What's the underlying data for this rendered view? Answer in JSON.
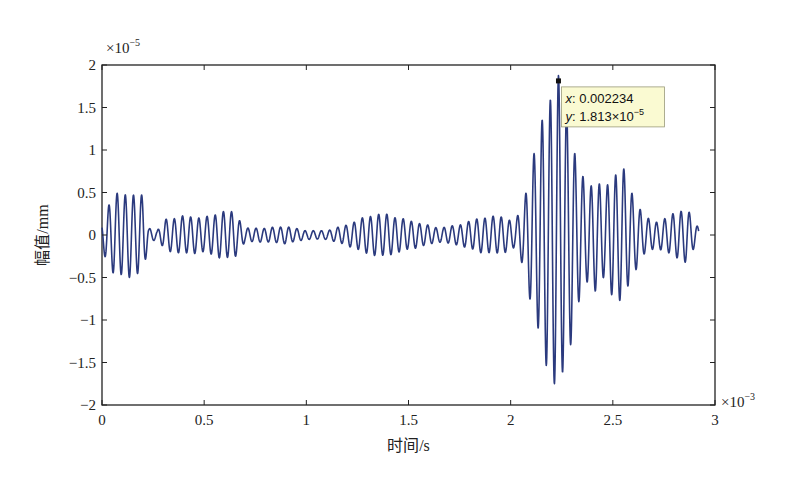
{
  "chart_data": {
    "type": "line",
    "title": "",
    "xlabel": "时间/s",
    "ylabel": "幅值/mm",
    "x_multiplier_label": "×10",
    "x_multiplier_exp": "−3",
    "y_multiplier_label": "×10",
    "y_multiplier_exp": "−5",
    "xlim": [
      0,
      3
    ],
    "ylim": [
      -2,
      2
    ],
    "x_ticks": [
      "0",
      "0.5",
      "1",
      "1.5",
      "2",
      "2.5",
      "3"
    ],
    "y_ticks": [
      "−2",
      "−1.5",
      "−1",
      "−0.5",
      "0",
      "0.5",
      "1",
      "1.5",
      "2"
    ],
    "grid": false,
    "legend": null,
    "line_color": "#2b3a7e",
    "series": [
      {
        "name": "displacement",
        "description": "Oscillating vibration signal (~25 kHz carrier) with amplitude envelope; x in ms (×10^-3 s), y in ×10^-5 mm",
        "x_end": 2.92,
        "carrier_period": 0.04,
        "envelope": [
          [
            0.0,
            0.15
          ],
          [
            0.03,
            0.35
          ],
          [
            0.06,
            0.47
          ],
          [
            0.1,
            0.48
          ],
          [
            0.15,
            0.48
          ],
          [
            0.2,
            0.45
          ],
          [
            0.23,
            0.08
          ],
          [
            0.27,
            0.05
          ],
          [
            0.31,
            0.18
          ],
          [
            0.4,
            0.22
          ],
          [
            0.5,
            0.2
          ],
          [
            0.6,
            0.28
          ],
          [
            0.65,
            0.26
          ],
          [
            0.7,
            0.08
          ],
          [
            0.8,
            0.08
          ],
          [
            0.9,
            0.1
          ],
          [
            1.0,
            0.05
          ],
          [
            1.1,
            0.05
          ],
          [
            1.2,
            0.12
          ],
          [
            1.3,
            0.22
          ],
          [
            1.38,
            0.25
          ],
          [
            1.45,
            0.2
          ],
          [
            1.55,
            0.14
          ],
          [
            1.65,
            0.08
          ],
          [
            1.75,
            0.12
          ],
          [
            1.85,
            0.2
          ],
          [
            1.95,
            0.22
          ],
          [
            2.02,
            0.15
          ],
          [
            2.06,
            0.35
          ],
          [
            2.1,
            0.8
          ],
          [
            2.15,
            1.3
          ],
          [
            2.2,
            1.7
          ],
          [
            2.234,
            1.813
          ],
          [
            2.27,
            1.55
          ],
          [
            2.32,
            0.9
          ],
          [
            2.37,
            0.55
          ],
          [
            2.42,
            0.65
          ],
          [
            2.46,
            0.5
          ],
          [
            2.5,
            0.72
          ],
          [
            2.55,
            0.78
          ],
          [
            2.6,
            0.45
          ],
          [
            2.66,
            0.2
          ],
          [
            2.72,
            0.15
          ],
          [
            2.8,
            0.25
          ],
          [
            2.86,
            0.32
          ],
          [
            2.9,
            0.15
          ],
          [
            2.92,
            0.08
          ]
        ]
      }
    ],
    "annotations": [
      {
        "type": "datatip",
        "x": 0.002234,
        "y": 1.813e-05,
        "x_text_label": "x",
        "x_text_value": ": 0.002234",
        "y_text_label": "y",
        "y_text_value": ": 1.813×10",
        "y_text_exp": "−5",
        "background": "#fafad2"
      }
    ]
  },
  "layout": {
    "plot_left": 102,
    "plot_right": 715,
    "plot_top": 65,
    "plot_bottom": 405
  }
}
